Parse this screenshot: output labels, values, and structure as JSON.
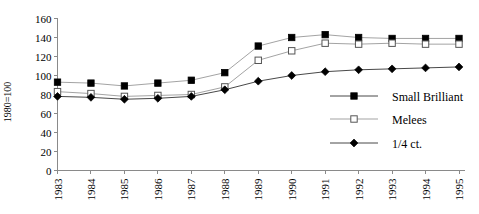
{
  "chart_data": {
    "type": "line",
    "title": "",
    "xlabel": "",
    "ylabel": "1980=100",
    "categories": [
      "1983",
      "1984",
      "1985",
      "1986",
      "1987",
      "1988",
      "1989",
      "1990",
      "1991",
      "1992",
      "1993",
      "1994",
      "1995"
    ],
    "ylim": [
      0,
      160
    ],
    "yticks": [
      0,
      20,
      40,
      60,
      80,
      100,
      120,
      140,
      160
    ],
    "grid": false,
    "legend_position": "right-middle",
    "series": [
      {
        "name": "Small Brilliant",
        "marker": "filled-square",
        "values": [
          93,
          92,
          89,
          92,
          95,
          103,
          131,
          140,
          143,
          140,
          139,
          139,
          139
        ]
      },
      {
        "name": "Melees",
        "marker": "open-square",
        "values": [
          83,
          81,
          78,
          79,
          80,
          88,
          116,
          126,
          134,
          133,
          134,
          133,
          133
        ]
      },
      {
        "name": "1/4 ct.",
        "marker": "filled-diamond",
        "values": [
          78,
          77,
          75,
          76,
          78,
          85,
          94,
          100,
          104,
          106,
          107,
          108,
          109
        ]
      }
    ]
  },
  "axes": {
    "y_title": "1980=100",
    "y_tick_labels": [
      "160",
      "140",
      "120",
      "100",
      "80",
      "60",
      "40",
      "20",
      "0"
    ],
    "x_tick_labels": [
      "1983",
      "1984",
      "1985",
      "1986",
      "1987",
      "1988",
      "1989",
      "1990",
      "1991",
      "1992",
      "1993",
      "1994",
      "1995"
    ]
  },
  "legend": {
    "items": [
      {
        "label": "Small Brilliant",
        "marker": "filled-square"
      },
      {
        "label": "Melees",
        "marker": "open-square"
      },
      {
        "label": "1/4 ct.",
        "marker": "filled-diamond"
      }
    ]
  },
  "colors": {
    "line_dark": "#333333",
    "line_light": "#999999",
    "axis": "#8a8a8a",
    "marker_fill": "#000000",
    "marker_open_fill": "#ffffff",
    "background": "#ffffff"
  }
}
